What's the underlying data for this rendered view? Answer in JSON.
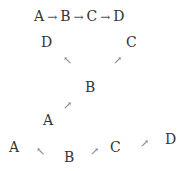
{
  "diagram1": {
    "nodes": [
      "A",
      "B",
      "C",
      "D"
    ],
    "arrow": "→"
  },
  "diagram2": {
    "nodes": {
      "D": "D",
      "C": "C",
      "B": "B",
      "A": "A"
    },
    "arrows": {
      "nw": "↖",
      "ne": "↗",
      "ne2": "↗"
    }
  },
  "diagram3": {
    "nodes": {
      "A": "A",
      "B": "B",
      "C": "C",
      "D": "D"
    },
    "arrows": {
      "left": "↖",
      "bc": "↗",
      "cd": "↗"
    }
  }
}
